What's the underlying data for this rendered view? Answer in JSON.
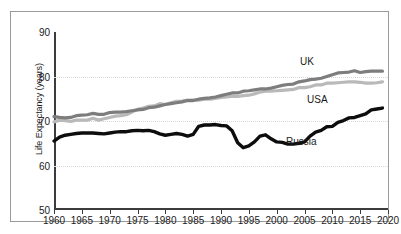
{
  "chart_data": {
    "type": "line",
    "title": "",
    "xlabel": "",
    "ylabel": "Life Expectancy (years)",
    "xlim": [
      1960,
      2020
    ],
    "ylim": [
      50,
      90
    ],
    "grid": true,
    "gridlines_y": [
      60,
      70,
      80
    ],
    "legend_position": "inline-annotations",
    "x_ticks": [
      1960,
      1965,
      1970,
      1975,
      1980,
      1985,
      1990,
      1995,
      2000,
      2005,
      2010,
      2015,
      2020
    ],
    "y_ticks": [
      50,
      60,
      70,
      80,
      90
    ],
    "x": [
      1960,
      1961,
      1962,
      1963,
      1964,
      1965,
      1966,
      1967,
      1968,
      1969,
      1970,
      1971,
      1972,
      1973,
      1974,
      1975,
      1976,
      1977,
      1978,
      1979,
      1980,
      1981,
      1982,
      1983,
      1984,
      1985,
      1986,
      1987,
      1988,
      1989,
      1990,
      1991,
      1992,
      1993,
      1994,
      1995,
      1996,
      1997,
      1998,
      1999,
      2000,
      2001,
      2002,
      2003,
      2004,
      2005,
      2006,
      2007,
      2008,
      2009,
      2010,
      2011,
      2012,
      2013,
      2014,
      2015,
      2016,
      2017,
      2018,
      2019
    ],
    "series": [
      {
        "name": "UK",
        "color": "#7d7d7d",
        "label": "UK",
        "values": [
          71.0,
          70.8,
          70.7,
          70.8,
          71.2,
          71.3,
          71.4,
          71.7,
          71.5,
          71.5,
          71.9,
          72.0,
          72.0,
          72.1,
          72.3,
          72.5,
          72.6,
          73.0,
          73.1,
          73.4,
          73.7,
          73.9,
          74.1,
          74.3,
          74.6,
          74.6,
          74.9,
          75.1,
          75.2,
          75.4,
          75.7,
          76.0,
          76.3,
          76.3,
          76.7,
          76.8,
          77.0,
          77.2,
          77.2,
          77.4,
          77.7,
          78.0,
          78.2,
          78.3,
          78.8,
          79.0,
          79.3,
          79.4,
          79.6,
          80.0,
          80.4,
          80.8,
          80.9,
          81.0,
          81.3,
          80.9,
          81.1,
          81.2,
          81.2,
          81.2
        ]
      },
      {
        "name": "USA",
        "color": "#b9b9b9",
        "label": "USA",
        "values": [
          69.8,
          70.2,
          70.1,
          69.9,
          70.2,
          70.2,
          70.2,
          70.6,
          70.2,
          70.5,
          70.8,
          71.1,
          71.2,
          71.4,
          72.0,
          72.6,
          72.9,
          73.3,
          73.4,
          73.9,
          73.7,
          74.1,
          74.4,
          74.5,
          74.7,
          74.7,
          74.7,
          74.9,
          74.9,
          75.1,
          75.3,
          75.4,
          75.6,
          75.5,
          75.7,
          75.8,
          76.1,
          76.5,
          76.7,
          76.7,
          76.8,
          76.9,
          77.0,
          77.1,
          77.5,
          77.5,
          77.7,
          78.1,
          78.1,
          78.5,
          78.5,
          78.6,
          78.7,
          78.8,
          78.8,
          78.7,
          78.5,
          78.5,
          78.6,
          78.8
        ]
      },
      {
        "name": "Russia",
        "color": "#0d0d0d",
        "label": "Russia",
        "values": [
          65.5,
          66.4,
          66.8,
          67.0,
          67.2,
          67.3,
          67.3,
          67.3,
          67.2,
          67.1,
          67.3,
          67.5,
          67.6,
          67.6,
          67.8,
          67.9,
          67.8,
          67.9,
          67.6,
          67.1,
          66.8,
          67.0,
          67.2,
          67.0,
          66.6,
          67.0,
          68.8,
          69.1,
          69.1,
          69.2,
          69.0,
          68.9,
          67.8,
          65.1,
          64.0,
          64.4,
          65.3,
          66.6,
          66.9,
          66.0,
          65.3,
          65.2,
          64.8,
          64.8,
          65.0,
          65.3,
          66.6,
          67.5,
          67.9,
          68.7,
          68.8,
          69.7,
          70.1,
          70.7,
          70.8,
          71.2,
          71.6,
          72.5,
          72.7,
          72.9
        ]
      }
    ]
  },
  "axes": {
    "y_title": "Life Expectancy (years)",
    "y_ticks": [
      "90",
      "80",
      "70",
      "60",
      "50"
    ],
    "x_ticks": [
      "1960",
      "1965",
      "1970",
      "1975",
      "1980",
      "1985",
      "1990",
      "1995",
      "2000",
      "2005",
      "2010",
      "2015",
      "2020"
    ]
  },
  "annotations": {
    "uk_label": "UK",
    "usa_label": "USA",
    "russia_label": "Russia"
  }
}
